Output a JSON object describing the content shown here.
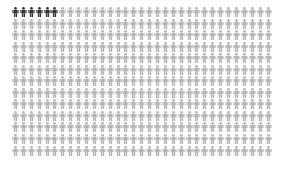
{
  "chart_data": {
    "type": "pictograph",
    "title": "",
    "icon": "person-icon",
    "columns": 33,
    "rows": 13,
    "total": 429,
    "highlighted": 6,
    "not_highlighted": 423,
    "colors": {
      "highlighted": "#333333",
      "default": "#b3b3b3",
      "background": "#ffffff"
    },
    "legend": []
  }
}
